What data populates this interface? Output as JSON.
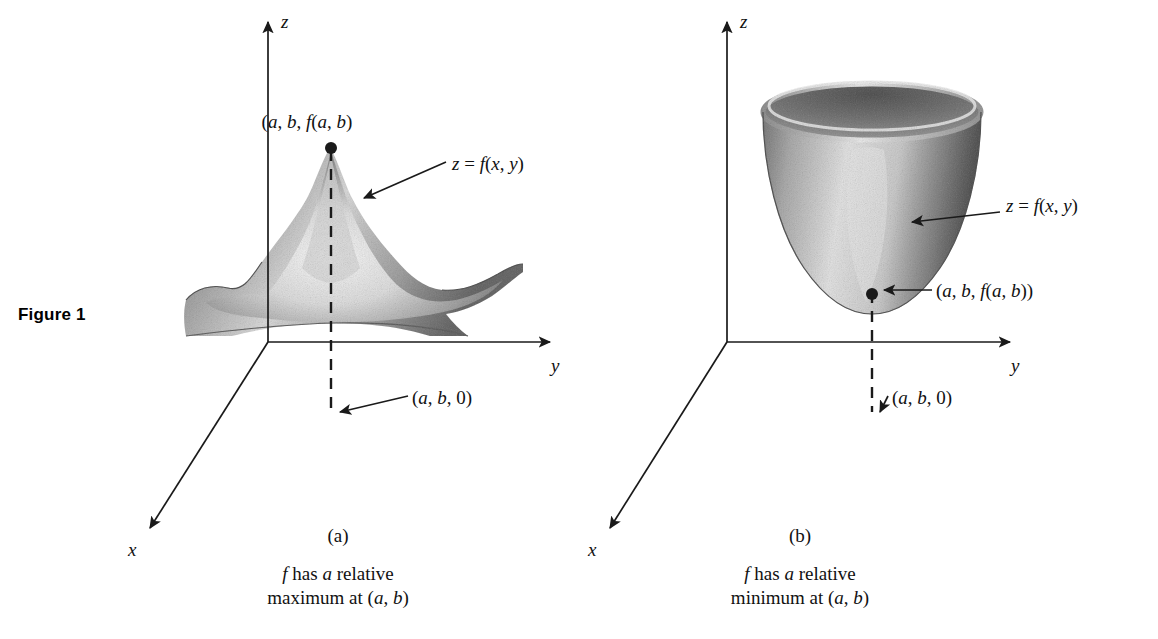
{
  "figure": {
    "label": "Figure 1"
  },
  "panels": [
    {
      "id": "panel-a",
      "panel_id": "(a)",
      "caption_line1": "f has a relative",
      "caption_line2": "maximum at (a, b)",
      "caption_italic_lead": "f",
      "surface_type": "peak",
      "axes": {
        "z": "z",
        "y": "y",
        "x": "x"
      },
      "annotations": {
        "point_label": "(a, b, f(a, b)",
        "surface_label": "z = f(x, y)",
        "base_point_label": "(a, b, 0)"
      }
    },
    {
      "id": "panel-b",
      "panel_id": "(b)",
      "caption_line1": "f has a relative",
      "caption_line2": "minimum at (a, b)",
      "caption_italic_lead": "f",
      "surface_type": "bowl",
      "axes": {
        "z": "z",
        "y": "y",
        "x": "x"
      },
      "annotations": {
        "point_label": "(a, b, f(a, b))",
        "surface_label": "z = f(x, y)",
        "base_point_label": "(a, b, 0)"
      }
    }
  ],
  "colors": {
    "ink": "#1a1a1a",
    "background": "#ffffff",
    "surface_light": "#f2f2f2",
    "surface_mid": "#b8b8b8",
    "surface_dark": "#8a8a8a"
  }
}
